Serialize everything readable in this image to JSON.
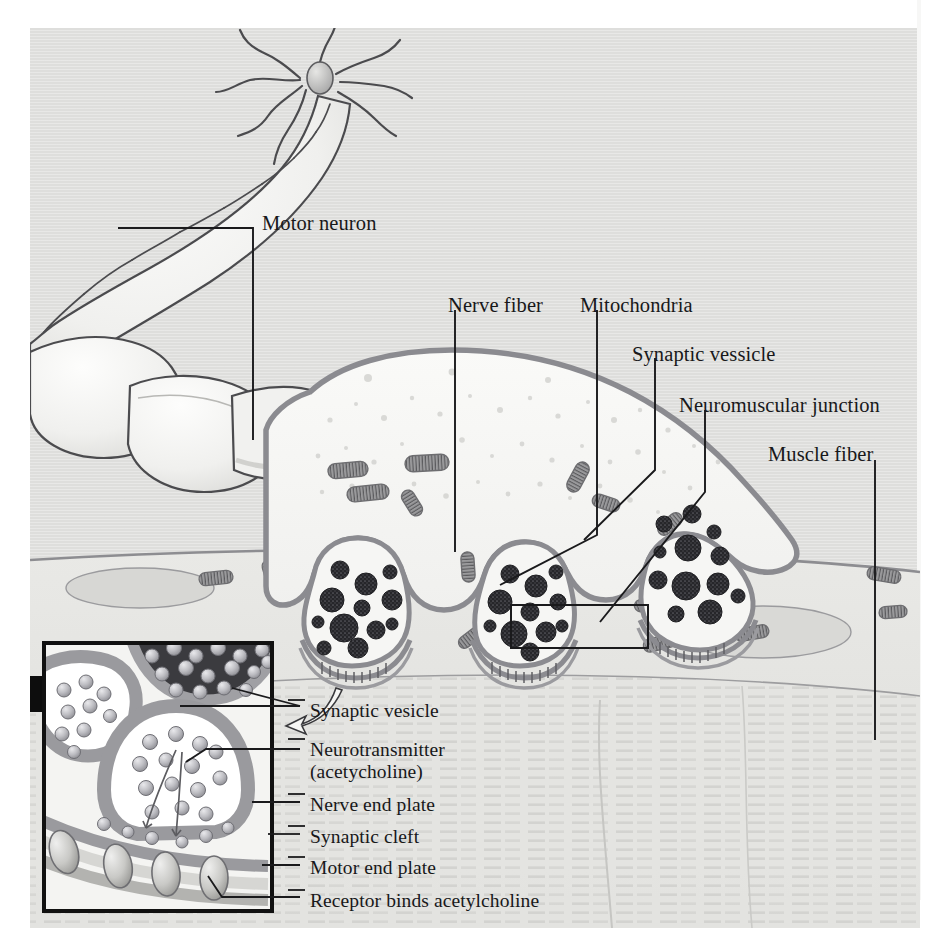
{
  "figure": {
    "background_color": "#dededc",
    "page_color": "#ffffff",
    "ink_color": "#18181a"
  },
  "main_labels": [
    {
      "id": "motor-neuron",
      "text": "Motor neuron",
      "x": 262,
      "y": 212
    },
    {
      "id": "nerve-fiber",
      "text": "Nerve fiber",
      "x": 448,
      "y": 294
    },
    {
      "id": "mitochondria",
      "text": "Mitochondria",
      "x": 580,
      "y": 294
    },
    {
      "id": "synaptic-vessicle",
      "text": "Synaptic vessicle",
      "x": 632,
      "y": 343
    },
    {
      "id": "neuromuscular-junction",
      "text": "Neuromuscular junction",
      "x": 679,
      "y": 394
    },
    {
      "id": "muscle-fiber",
      "text": "Muscle fiber",
      "x": 768,
      "y": 443
    }
  ],
  "inset_labels": [
    {
      "id": "synaptic-vesicle",
      "text": "Synaptic vesicle",
      "x": 310,
      "y": 700
    },
    {
      "id": "neurotransmitter",
      "text": "Neurotransmitter",
      "x": 310,
      "y": 739
    },
    {
      "id": "neurotransmitter-sub",
      "text": "(acetycholine)",
      "x": 310,
      "y": 761
    },
    {
      "id": "nerve-end-plate",
      "text": "Nerve end plate",
      "x": 310,
      "y": 794
    },
    {
      "id": "synaptic-cleft",
      "text": "Synaptic cleft",
      "x": 310,
      "y": 826
    },
    {
      "id": "motor-end-plate",
      "text": "Motor end plate",
      "x": 310,
      "y": 857
    },
    {
      "id": "receptor-binds-acetylcholine",
      "text": "Receptor binds acetylcholine",
      "x": 310,
      "y": 890
    }
  ],
  "colors": {
    "membrane": "#8b8b90",
    "terminal_fill": "#f4f4f2",
    "vesicle_dark": "#2c2c2e",
    "muscle": "#d2d2cf",
    "inset_frame": "#111111",
    "inset_membrane": "#8e8e93",
    "inset_light": "#f3f3f1",
    "neurotransmitter": "#b9b9bd",
    "leader": "#1a1a1c"
  },
  "structures": {
    "soma": "motor neuron cell body with dendrites and nucleus",
    "axon": "myelinated axon with nodes of Ranvier",
    "terminal": "axon terminal containing mitochondria and synaptic vesicles",
    "synapses": 3,
    "muscle": "striated muscle fiber with nuclei and mitochondria",
    "inset": "magnified view of synapse showing vesicles, cleft and receptors"
  }
}
